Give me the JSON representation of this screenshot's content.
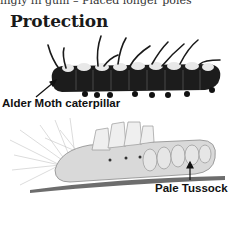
{
  "page": {
    "cut_text": "ingly in gum – Placed longer poles",
    "title": "Protection"
  },
  "illustrations": [
    {
      "name": "Alder Moth caterpillar",
      "label": "Alder Moth caterpillar"
    },
    {
      "name": "Pale Tussock",
      "label": "Pale Tussock"
    }
  ]
}
